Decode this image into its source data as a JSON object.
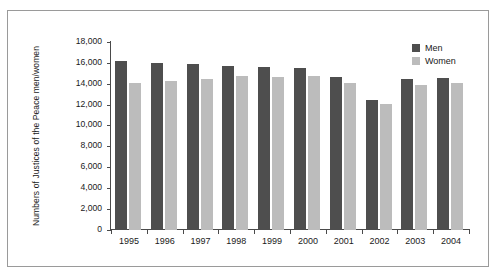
{
  "chart_data": {
    "type": "bar",
    "title": "",
    "xlabel": "",
    "ylabel": "Numbers of Justices of the Peace men/women",
    "categories": [
      "1995",
      "1996",
      "1997",
      "1998",
      "1999",
      "2000",
      "2001",
      "2002",
      "2003",
      "2004"
    ],
    "series": [
      {
        "name": "Men",
        "color": "#4e4e4e",
        "values": [
          16250,
          16050,
          15900,
          15750,
          15650,
          15600,
          14650,
          12450,
          14450,
          14600
        ]
      },
      {
        "name": "Women",
        "color": "#bcbcbc",
        "values": [
          14150,
          14350,
          14500,
          14750,
          14700,
          14800,
          14150,
          12100,
          13950,
          14150
        ]
      }
    ],
    "ylim": [
      0,
      18000
    ],
    "ytick_step": 2000,
    "ytick_labels": [
      "18,000",
      "16,000",
      "14,000",
      "12,000",
      "10,000",
      "8,000",
      "6,000",
      "4,000",
      "2,000",
      "0"
    ],
    "ytick_values": [
      18000,
      16000,
      14000,
      12000,
      10000,
      8000,
      6000,
      4000,
      2000,
      0
    ],
    "grid": false,
    "legend_position": "top-right",
    "legend_entries": [
      "Men",
      "Women"
    ]
  }
}
